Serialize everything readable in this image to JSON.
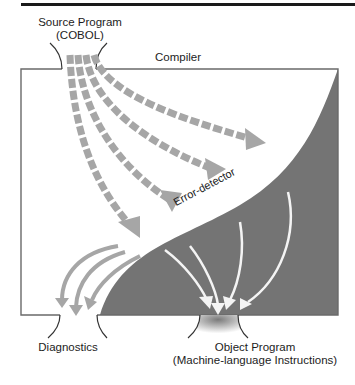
{
  "diagram": {
    "title": "Compiler",
    "colors": {
      "box_stroke": "#6a6a6a",
      "dark_region": "#747474",
      "dashed_arrow": "#a6a6a6",
      "error_arrow": "#a6a6a6",
      "object_arrow": "#f4f4f4",
      "text": "#1c1c1c"
    },
    "nodes": {
      "source": {
        "line1": "Source Program",
        "line2": "(COBOL)"
      },
      "compiler": {
        "label": "Compiler"
      },
      "error_detector": {
        "label": "Error-detector"
      },
      "diagnostics": {
        "label": "Diagnostics"
      },
      "object": {
        "line1": "Object Program",
        "line2": "(Machine-language Instructions)"
      }
    },
    "flows": [
      {
        "from": "source",
        "to": "error_detector",
        "style": "dashed-gray",
        "count": 4
      },
      {
        "from": "error_detector",
        "to": "diagnostics",
        "style": "solid-gray",
        "count": 3
      },
      {
        "from": "error_detector",
        "to": "object",
        "style": "solid-white",
        "count": 4
      }
    ]
  }
}
